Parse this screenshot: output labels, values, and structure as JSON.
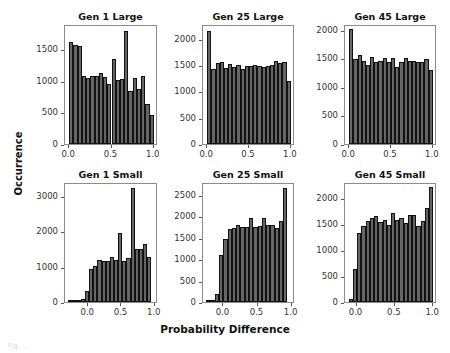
{
  "figure": {
    "ylabel": "Occurrence",
    "xlabel": "Probability Difference",
    "caption": "Fig. ..."
  },
  "chart_data": [
    {
      "type": "bar",
      "title": "Gen 1 Large",
      "xlabel": "",
      "ylabel": "Occurrence",
      "xlim": [
        -0.05,
        1.05
      ],
      "ylim": [
        0,
        1900
      ],
      "xticks": [
        "0.0",
        "0.5",
        "1.0"
      ],
      "yticks": [
        "0",
        "500",
        "1000",
        "1500"
      ],
      "ytick_values": [
        0,
        500,
        1000,
        1500
      ],
      "bin_start": 0.0,
      "bin_width": 0.05,
      "values": [
        1620,
        1560,
        1550,
        1070,
        1040,
        1070,
        1080,
        1120,
        1060,
        950,
        1340,
        1010,
        1030,
        1790,
        840,
        1040,
        870,
        1080,
        640,
        460
      ]
    },
    {
      "type": "bar",
      "title": "Gen 25 Large",
      "xlabel": "",
      "ylabel": "",
      "xlim": [
        -0.05,
        1.05
      ],
      "ylim": [
        0,
        2280
      ],
      "xticks": [
        "0.0",
        "0.5",
        "1.0"
      ],
      "yticks": [
        "0",
        "500",
        "1000",
        "1500",
        "2000"
      ],
      "ytick_values": [
        0,
        500,
        1000,
        1500,
        2000
      ],
      "bin_start": 0.0,
      "bin_width": 0.05,
      "values": [
        2150,
        1420,
        1530,
        1560,
        1450,
        1520,
        1470,
        1510,
        1430,
        1490,
        1490,
        1500,
        1490,
        1470,
        1490,
        1510,
        1570,
        1530,
        1550,
        1200
      ]
    },
    {
      "type": "bar",
      "title": "Gen 45 Large",
      "xlabel": "",
      "ylabel": "",
      "xlim": [
        -0.05,
        1.05
      ],
      "ylim": [
        0,
        2100
      ],
      "xticks": [
        "0.0",
        "0.5",
        "1.0"
      ],
      "yticks": [
        "0",
        "500",
        "1000",
        "1500",
        "2000"
      ],
      "ytick_values": [
        0,
        500,
        1000,
        1500,
        2000
      ],
      "bin_start": 0.0,
      "bin_width": 0.05,
      "values": [
        2010,
        1480,
        1550,
        1450,
        1380,
        1520,
        1430,
        1460,
        1500,
        1440,
        1500,
        1350,
        1430,
        1500,
        1460,
        1460,
        1440,
        1440,
        1490,
        1290
      ]
    },
    {
      "type": "bar",
      "title": "Gen 1 Small",
      "xlabel": "",
      "ylabel": "Occurrence",
      "xlim": [
        -0.35,
        1.05
      ],
      "ylim": [
        0,
        3400
      ],
      "xticks": [
        "0.0",
        "0.5",
        "1.0"
      ],
      "yticks": [
        "0",
        "1000",
        "2000",
        "3000"
      ],
      "ytick_values": [
        0,
        1000,
        2000,
        3000
      ],
      "bin_start": -0.3,
      "bin_width": 0.0625,
      "values": [
        10,
        20,
        30,
        80,
        310,
        940,
        1020,
        1180,
        1160,
        1170,
        1280,
        1190,
        1950,
        1160,
        1250,
        3220,
        1490,
        1510,
        1640,
        1280
      ]
    },
    {
      "type": "bar",
      "title": "Gen 25 Small",
      "xlabel": "Probability Difference",
      "ylabel": "",
      "xlim": [
        -0.3,
        1.05
      ],
      "ylim": [
        0,
        2800
      ],
      "xticks": [
        "0.0",
        "0.5",
        "1.0"
      ],
      "yticks": [
        "0",
        "500",
        "1000",
        "1500",
        "2000",
        "2500"
      ],
      "ytick_values": [
        0,
        500,
        1000,
        1500,
        2000,
        2500
      ],
      "bin_start": -0.25,
      "bin_width": 0.0625,
      "values": [
        10,
        30,
        180,
        1100,
        1460,
        1700,
        1730,
        1800,
        1760,
        1760,
        1960,
        1740,
        1770,
        1950,
        1800,
        1790,
        1730,
        1890,
        2650,
        0
      ]
    },
    {
      "type": "bar",
      "title": "Gen 45 Small",
      "xlabel": "",
      "ylabel": "",
      "xlim": [
        -0.15,
        1.05
      ],
      "ylim": [
        0,
        2300
      ],
      "xticks": [
        "0.0",
        "0.5",
        "1.0"
      ],
      "yticks": [
        "0",
        "500",
        "1000",
        "1500",
        "2000"
      ],
      "ytick_values": [
        0,
        500,
        1000,
        1500,
        2000
      ],
      "bin_start": -0.1,
      "bin_width": 0.055,
      "values": [
        60,
        640,
        1330,
        1460,
        1550,
        1610,
        1640,
        1530,
        1570,
        1480,
        1710,
        1580,
        1610,
        1520,
        1670,
        1670,
        1460,
        1550,
        1800,
        2200
      ]
    }
  ]
}
